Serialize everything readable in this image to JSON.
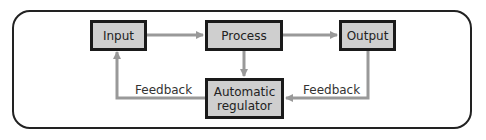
{
  "diagram": {
    "nodes": {
      "input": "Input",
      "process": "Process",
      "output": "Output",
      "regulator_line1": "Automatic",
      "regulator_line2": "regulator"
    },
    "edge_labels": {
      "feedback_left": "Feedback",
      "feedback_right": "Feedback"
    },
    "colors": {
      "box_fill": "#cfcfcf",
      "box_border": "#1a1a1a",
      "arrow": "#999999",
      "frame": "#222222"
    }
  }
}
